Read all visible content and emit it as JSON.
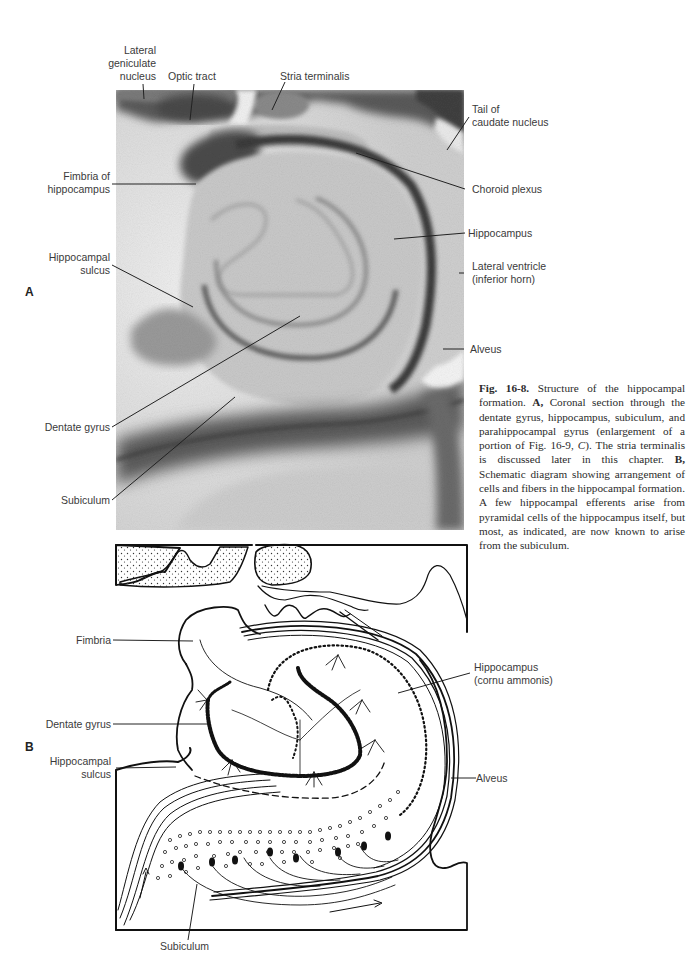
{
  "figure": {
    "number": "Fig. 16-8.",
    "panels": {
      "A": {
        "letter": "A",
        "type": "photomicrograph",
        "labels": {
          "lateral_geniculate_nucleus": "Lateral\ngeniculate\nnucleus",
          "optic_tract": "Optic tract",
          "stria_terminalis": "Stria terminalis",
          "tail_of_caudate_nucleus": "Tail of\ncaudate nucleus",
          "fimbria_of_hippocampus": "Fimbria of\nhippocampus",
          "choroid_plexus": "Choroid plexus",
          "hippocampus": "Hippocampus",
          "hippocampal_sulcus": "Hippocampal\nsulcus",
          "lateral_ventricle": "Lateral ventricle\n(inferior horn)",
          "alveus": "Alveus",
          "dentate_gyrus": "Dentate gyrus",
          "subiculum": "Subiculum"
        }
      },
      "B": {
        "letter": "B",
        "type": "schematic diagram",
        "labels": {
          "fimbria": "Fimbria",
          "hippocampus": "Hippocampus\n(cornu ammonis)",
          "dentate_gyrus": "Dentate gyrus",
          "hippocampal_sulcus": "Hippocampal\nsulcus",
          "alveus": "Alveus",
          "subiculum": "Subiculum"
        }
      }
    },
    "caption": {
      "title": "Structure of the hippocampal formation.",
      "part_a_letter": "A,",
      "part_a_text": "Coronal section through the dentate gyrus, hippocampus, subiculum, and parahippocampal gyrus (enlargement of a portion of Fig. 16-9,",
      "part_a_ref_italic": "C",
      "part_a_tail": "). The stria terminalis is discussed later in this chapter.",
      "part_b_letter": "B,",
      "part_b_text": "Schematic diagram showing arrangement of cells and fibers in the hippocampal formation. A few hippocampal efferents arise from pyramidal cells of the hippocampus itself, but most, as indicated, are now known to arise from the subiculum."
    }
  }
}
